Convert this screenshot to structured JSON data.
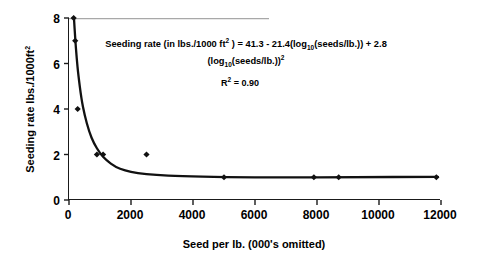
{
  "chart_data": {
    "type": "scatter",
    "title": "",
    "xlabel": "Seed per lb. (000's omitted)",
    "ylabel": "Seeding rate lbs./1000ft²",
    "xlim": [
      0,
      12000
    ],
    "ylim": [
      0,
      8
    ],
    "grid": false,
    "legend": "none",
    "x_ticks": [
      "0",
      "2000",
      "4000",
      "6000",
      "8000",
      "10000",
      "12000"
    ],
    "x_tick_values": [
      0,
      2000,
      4000,
      6000,
      8000,
      10000,
      12000
    ],
    "y_ticks": [
      "0",
      "2",
      "4",
      "6",
      "8"
    ],
    "y_tick_values": [
      0,
      2,
      4,
      6,
      8
    ],
    "series": [
      {
        "name": "observed seeding rate",
        "type": "scatter",
        "marker": "diamond",
        "color": "#111111",
        "points": [
          {
            "x": 150,
            "y": 8
          },
          {
            "x": 200,
            "y": 7
          },
          {
            "x": 280,
            "y": 4
          },
          {
            "x": 900,
            "y": 2
          },
          {
            "x": 1100,
            "y": 2
          },
          {
            "x": 2500,
            "y": 2
          },
          {
            "x": 5000,
            "y": 1
          },
          {
            "x": 7900,
            "y": 1
          },
          {
            "x": 8700,
            "y": 1
          },
          {
            "x": 11850,
            "y": 1
          }
        ]
      },
      {
        "name": "fitted regression curve",
        "type": "line",
        "color": "#111111",
        "points": [
          {
            "x": 160,
            "y": 8.0
          },
          {
            "x": 200,
            "y": 7.1
          },
          {
            "x": 250,
            "y": 6.2
          },
          {
            "x": 300,
            "y": 5.5
          },
          {
            "x": 400,
            "y": 4.45
          },
          {
            "x": 500,
            "y": 3.75
          },
          {
            "x": 650,
            "y": 3.0
          },
          {
            "x": 800,
            "y": 2.5
          },
          {
            "x": 1000,
            "y": 2.05
          },
          {
            "x": 1200,
            "y": 1.75
          },
          {
            "x": 1500,
            "y": 1.45
          },
          {
            "x": 1800,
            "y": 1.3
          },
          {
            "x": 2200,
            "y": 1.18
          },
          {
            "x": 2800,
            "y": 1.1
          },
          {
            "x": 3600,
            "y": 1.05
          },
          {
            "x": 5000,
            "y": 1.0
          },
          {
            "x": 7000,
            "y": 0.99
          },
          {
            "x": 9000,
            "y": 1.0
          },
          {
            "x": 11900,
            "y": 1.02
          }
        ]
      }
    ],
    "annotations": {
      "equation_line1_prefix": "Seeding rate (in lbs./1000 ft",
      "equation_line1_sup": "2",
      "equation_line1_mid": " ) = 41.3 - 21.4(log",
      "equation_line1_sub": "10",
      "equation_line1_suffix": "(seeds/lb.)) + 2.8",
      "equation_line2_prefix": "(log",
      "equation_line2_sub": "10",
      "equation_line2_mid": "(seeds/lb.))",
      "equation_line2_sup": "2",
      "r_squared_prefix": "R",
      "r_squared_sup": "2",
      "r_squared_value": " = 0.90"
    },
    "axis_title_y_prefix": "Seeding rate lbs./1000ft",
    "axis_title_y_sup": "2"
  }
}
